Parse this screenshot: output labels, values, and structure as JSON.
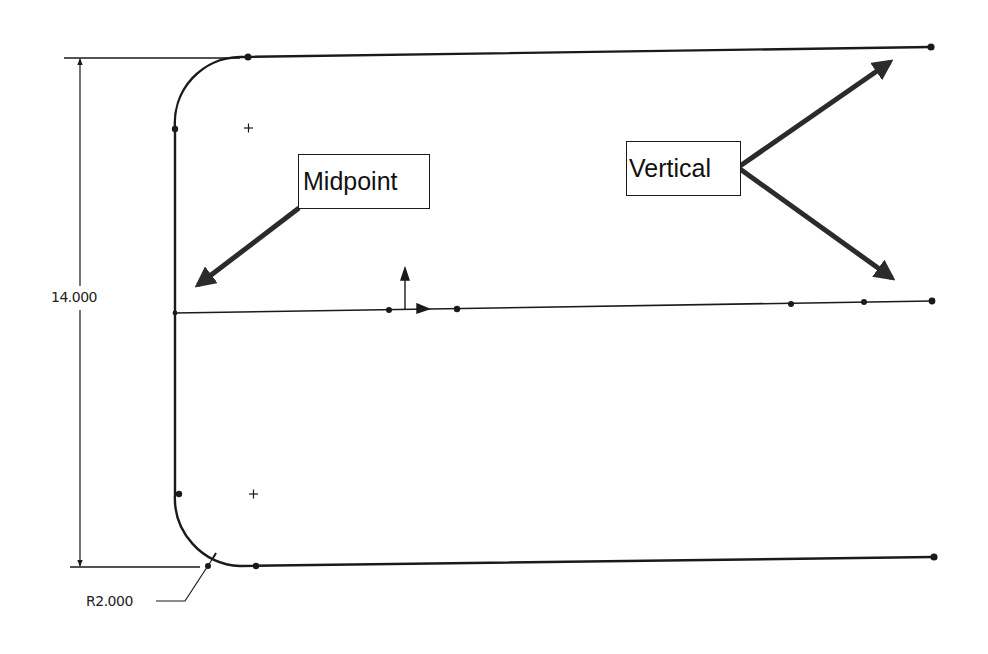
{
  "diagram": {
    "type": "cad-sketch",
    "callouts": {
      "midpoint": {
        "label": "Midpoint"
      },
      "vertical": {
        "label": "Vertical"
      }
    },
    "dimensions": {
      "height": {
        "label": "14.000",
        "value": 14.0
      },
      "radius": {
        "label": "R2.000",
        "value": 2.0
      }
    },
    "colors": {
      "line": "#1a1a1a",
      "arrow": "#2b2b2b",
      "background": "#ffffff"
    }
  }
}
